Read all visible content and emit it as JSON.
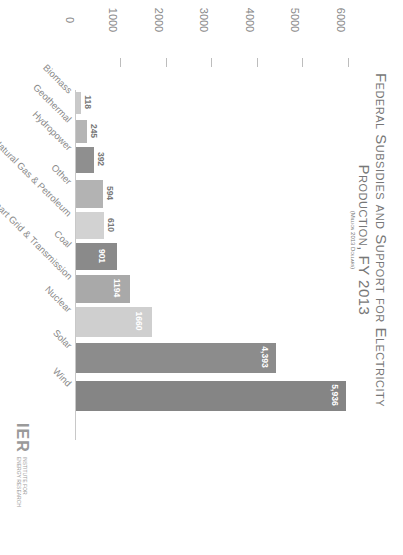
{
  "chart_data": {
    "type": "bar",
    "orientation": "rotated 90 degrees (bars extend horizontally to the right in image)",
    "title": "Federal Subsidies and Support for Electricity Production, FY 2013",
    "subtitle": "(Million 2013 Dollars)",
    "categories": [
      "Biomass",
      "Geothermal",
      "Hydropower",
      "Other",
      "Natural Gas & Petroleum",
      "Coal",
      "Smart Grid & Transmission",
      "Nuclear",
      "Solar",
      "Wind"
    ],
    "values": [
      118,
      245,
      392,
      594,
      610,
      901,
      1194,
      1660,
      4393,
      5936
    ],
    "value_labels": [
      "118",
      "245",
      "392",
      "594",
      "610",
      "901",
      "1194",
      "1660",
      "4,393",
      "5,936"
    ],
    "xlabel": "",
    "ylabel": "",
    "ylim": [
      0,
      6000
    ],
    "yticks": [
      "0",
      "1000",
      "2000",
      "3000",
      "4000",
      "5000",
      "6000"
    ],
    "grid": false,
    "legend": null,
    "source_logo": "IER Institute for Energy Research"
  },
  "title": {
    "line1": "Federal Subsidies and Support for Electricity",
    "line2": "Production, FY 2013",
    "line3": "(Million 2013 Dollars)"
  },
  "axis": {
    "ticks": [
      "0",
      "1000",
      "2000",
      "3000",
      "4000",
      "5000",
      "6000"
    ]
  },
  "bars": [
    {
      "label": "Biomass",
      "value": "118",
      "color": "#c9c9c9"
    },
    {
      "label": "Geothermal",
      "value": "245",
      "color": "#b5b5b5"
    },
    {
      "label": "Hydropower",
      "value": "392",
      "color": "#8f8f8f"
    },
    {
      "label": "Other",
      "value": "594",
      "color": "#b3b3b3"
    },
    {
      "label": "Natural Gas & Petroleum",
      "value": "610",
      "color": "#d2d2d2"
    },
    {
      "label": "Coal",
      "value": "901",
      "color": "#8a8a8a"
    },
    {
      "label": "Smart Grid & Transmission",
      "value": "1194",
      "color": "#a9a9a9"
    },
    {
      "label": "Nuclear",
      "value": "1660",
      "color": "#cfcfcf"
    },
    {
      "label": "Solar",
      "value": "4,393",
      "color": "#8c8c8c"
    },
    {
      "label": "Wind",
      "value": "5,936",
      "color": "#858585"
    }
  ],
  "logo": {
    "mark": "IER",
    "line1": "Institute for",
    "line2": "Energy Research"
  }
}
